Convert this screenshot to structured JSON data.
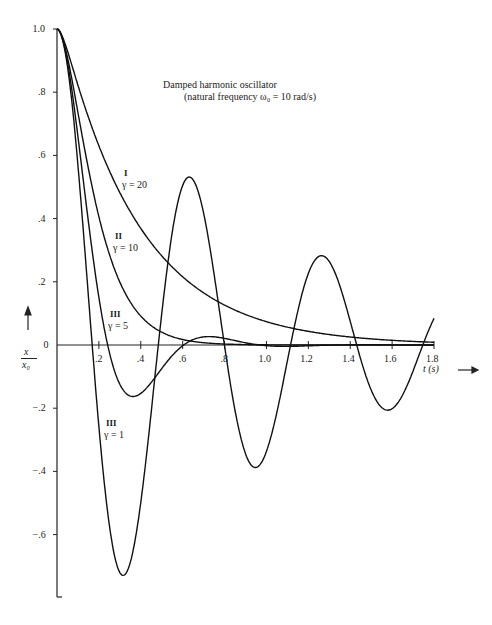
{
  "chart_data": {
    "type": "line",
    "title": "Damped harmonic oscillator",
    "subtitle": "(natural frequency ω₀ = 10 rad/s)",
    "xlabel": "t (s)",
    "ylabel": "x / x₀",
    "xlim": [
      0,
      1.8
    ],
    "ylim": [
      -0.8,
      1.0
    ],
    "x_ticks": [
      ".2",
      ".4",
      ".6",
      ".8",
      "1.0",
      "1.2",
      "1.4",
      "1.6",
      "1.8"
    ],
    "y_ticks": [
      "1.0",
      ".8",
      ".6",
      ".4",
      ".2",
      "0",
      "−.2",
      "−.4",
      "−.6"
    ],
    "grid": false,
    "legend": "inline labels",
    "series": [
      {
        "name": "I γ = 20",
        "roman": "I",
        "gamma_label": "γ = 20",
        "gamma": 20,
        "regime": "overdamped",
        "x": [
          0,
          0.1,
          0.2,
          0.3,
          0.4,
          0.6,
          0.8,
          1.0,
          1.2,
          1.4,
          1.6,
          1.8
        ],
        "values": [
          1.0,
          0.82,
          0.63,
          0.48,
          0.37,
          0.22,
          0.13,
          0.07,
          0.04,
          0.025,
          0.015,
          0.01
        ]
      },
      {
        "name": "II γ = 10",
        "roman": "II",
        "gamma_label": "γ = 10",
        "gamma": 10,
        "regime": "critically damped",
        "x": [
          0,
          0.1,
          0.2,
          0.3,
          0.4,
          0.6,
          0.8,
          1.0
        ],
        "values": [
          1.0,
          0.74,
          0.41,
          0.2,
          0.09,
          0.02,
          0.003,
          0.0
        ]
      },
      {
        "name": "III γ = 5",
        "roman": "III",
        "gamma_label": "γ = 5",
        "gamma": 5,
        "regime": "underdamped",
        "x": [
          0,
          0.1,
          0.2,
          0.3,
          0.36,
          0.5,
          0.6,
          0.75,
          0.9,
          1.0,
          1.2
        ],
        "values": [
          1.0,
          0.69,
          0.15,
          -0.12,
          -0.16,
          -0.07,
          0.0,
          0.03,
          0.01,
          0.0,
          0.0
        ]
      },
      {
        "name": "III γ = 1",
        "roman": "III",
        "gamma_label": "γ = 1",
        "gamma": 1,
        "regime": "underdamped",
        "x": [
          0,
          0.16,
          0.31,
          0.47,
          0.63,
          0.79,
          0.94,
          1.1,
          1.26,
          1.42,
          1.57,
          1.73,
          1.8
        ],
        "values": [
          1.0,
          0.0,
          -0.72,
          0.0,
          0.52,
          0.0,
          -0.37,
          0.0,
          0.28,
          0.0,
          -0.19,
          0.0,
          0.09
        ]
      }
    ]
  },
  "labels": {
    "title": "Damped harmonic oscillator",
    "subtitle": "(natural frequency ω₀ = 10 rad/s)",
    "xaxis": "t (s)  ⟶",
    "yaxis_num": "x",
    "yaxis_den": "x₀",
    "c1_roman": "I",
    "c1_gamma": "γ = 20",
    "c2_roman": "II",
    "c2_gamma": "γ = 10",
    "c3_roman": "III",
    "c3_gamma": "γ = 5",
    "c4_roman": "III",
    "c4_gamma": "γ = 1"
  }
}
